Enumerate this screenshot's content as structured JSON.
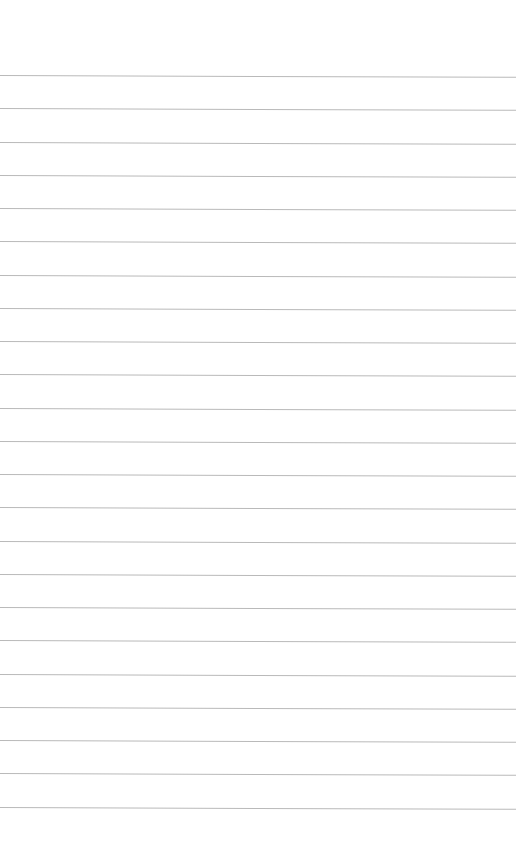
{
  "page": {
    "type": "lined-paper",
    "background_color": "#ffffff",
    "rule_color": "#b9b9b9",
    "rule_count": 23,
    "first_rule_y": 75,
    "rule_spacing": 33.25
  }
}
